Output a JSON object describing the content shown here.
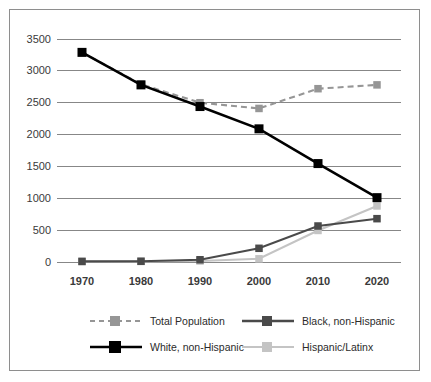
{
  "chart_data": {
    "type": "line",
    "title": "",
    "subtitle": "",
    "xlabel": "",
    "ylabel": "",
    "categories": [
      "1970",
      "1980",
      "1990",
      "2000",
      "2010",
      "2020"
    ],
    "x": [
      1970,
      1980,
      1990,
      2000,
      2010,
      2020
    ],
    "xlim": [
      1965,
      2025
    ],
    "ylim": [
      0,
      3500
    ],
    "yticks": [
      "0",
      "500",
      "1000",
      "1500",
      "2000",
      "2500",
      "3000",
      "3500"
    ],
    "ytick_values": [
      0,
      500,
      1000,
      1500,
      2000,
      2500,
      3000,
      3500
    ],
    "grid": "horizontal",
    "legend_position": "bottom",
    "series": [
      {
        "name": "Total Population",
        "values": [
          3290,
          2790,
          2500,
          2410,
          2720,
          2780
        ],
        "color": "#969696",
        "style": "dashed",
        "marker": "square"
      },
      {
        "name": "Black, non-Hispanic",
        "values": [
          10,
          12,
          35,
          215,
          565,
          680
        ],
        "color": "#4a4a4a",
        "style": "solid",
        "marker": "square"
      },
      {
        "name": "White, non-Hispanic",
        "values": [
          3290,
          2780,
          2440,
          2090,
          1545,
          1010
        ],
        "color": "#000000",
        "style": "solid",
        "marker": "square"
      },
      {
        "name": "Hispanic/Latinx",
        "values": [
          5,
          8,
          15,
          50,
          495,
          880
        ],
        "color": "#c4c4c4",
        "style": "solid",
        "marker": "square"
      }
    ]
  },
  "legend": {
    "items": [
      {
        "label": "Total Population",
        "key": "total-population"
      },
      {
        "label": "Black, non-Hispanic",
        "key": "black-non-hispanic"
      },
      {
        "label": "White, non-Hispanic",
        "key": "white-non-hispanic"
      },
      {
        "label": "Hispanic/Latinx",
        "key": "hispanic-latinx"
      }
    ]
  },
  "colors": {
    "frame": "#8e8e8e",
    "gridline": "#878787",
    "total_population": "#969696",
    "black_non_hispanic": "#4a4a4a",
    "white_non_hispanic": "#000000",
    "hispanic_latinx": "#c4c4c4",
    "tick_text": "#3a3a3a"
  }
}
